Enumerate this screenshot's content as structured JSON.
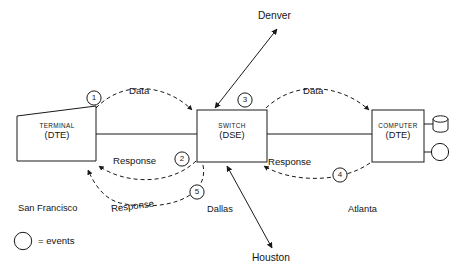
{
  "diagram": {
    "stroke_color": "#1a1a1a",
    "background_color": "#ffffff",
    "nodes": [
      {
        "id": "terminal",
        "shape": "trapezoid",
        "title": "TERMINAL",
        "subtitle": "(DTE)",
        "city": "San Francisco"
      },
      {
        "id": "switch",
        "shape": "rectangle",
        "title": "SWITCH",
        "subtitle": "(DSE)",
        "city": "Dallas"
      },
      {
        "id": "computer",
        "shape": "rectangle",
        "title": "COMPUTER",
        "subtitle": "(DTE)",
        "city": "Atlanta"
      }
    ],
    "peripherals": [
      {
        "id": "disk",
        "shape": "cylinder"
      },
      {
        "id": "tape",
        "shape": "circle"
      }
    ],
    "remote_sites": [
      {
        "id": "denver",
        "label": "Denver",
        "direction": "up-right",
        "link": "bidirectional"
      },
      {
        "id": "houston",
        "label": "Houston",
        "direction": "down-left",
        "link": "bidirectional"
      }
    ],
    "flows": [
      {
        "id": "data-left",
        "label": "Data",
        "from": "terminal",
        "to": "switch",
        "style": "dashed-arc-above"
      },
      {
        "id": "response-left",
        "label": "Response",
        "from": "switch",
        "to": "terminal",
        "style": "dashed-arc-below"
      },
      {
        "id": "data-right",
        "label": "Data",
        "from": "switch",
        "to": "computer",
        "style": "dashed-arc-above"
      },
      {
        "id": "response-right",
        "label": "Response",
        "from": "computer",
        "to": "switch",
        "style": "dashed-arc-below"
      },
      {
        "id": "response-long",
        "label": "Response",
        "from": "switch",
        "to": "terminal",
        "style": "dashed-arc-outer-below"
      }
    ],
    "events": [
      {
        "number": "1",
        "at": "terminal-data-out"
      },
      {
        "number": "2",
        "at": "switch-response-out"
      },
      {
        "number": "3",
        "at": "switch-data-out"
      },
      {
        "number": "4",
        "at": "computer-response-out"
      },
      {
        "number": "5",
        "at": "switch-response-long-out"
      }
    ],
    "legend": {
      "symbol": "circle",
      "text": "= events"
    }
  }
}
